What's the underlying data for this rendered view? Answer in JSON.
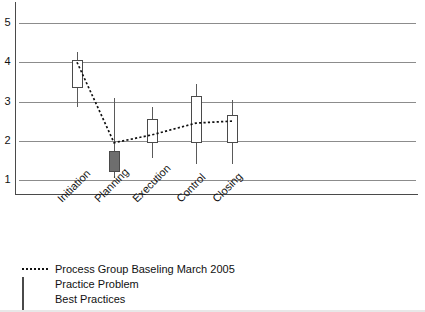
{
  "chart_data": {
    "type": "bar",
    "title": "",
    "subtitle": "",
    "xlabel": "",
    "ylabel": "",
    "categories": [
      "Initiation",
      "Planning",
      "Execution",
      "Control",
      "Closing"
    ],
    "ylim": [
      0.6,
      5.45
    ],
    "yticks": [
      1,
      2,
      3,
      4,
      5
    ],
    "ytick_labels": [
      "1",
      "2",
      "3",
      "4",
      "5"
    ],
    "grid": true,
    "legend_position": "below-axes-left",
    "boxes": [
      {
        "category": "Initiation",
        "kind": "Best Practices",
        "color": "#ffffff",
        "box_low": 3.35,
        "box_high": 4.05,
        "whisker_low": 2.85,
        "whisker_high": 4.25
      },
      {
        "category": "Planning",
        "kind": "Practice Problem",
        "color": "#6e6e6e",
        "box_low": 1.2,
        "box_high": 1.75,
        "whisker_low": 1.05,
        "whisker_high": 3.1
      },
      {
        "category": "Execution",
        "kind": "Best Practices",
        "color": "#ffffff",
        "box_low": 1.95,
        "box_high": 2.55,
        "whisker_low": 1.55,
        "whisker_high": 2.85
      },
      {
        "category": "Control",
        "kind": "Best Practices",
        "color": "#ffffff",
        "box_low": 1.95,
        "box_high": 3.15,
        "whisker_low": 1.4,
        "whisker_high": 3.45
      },
      {
        "category": "Closing",
        "kind": "Best Practices",
        "color": "#ffffff",
        "box_low": 1.95,
        "box_high": 2.65,
        "whisker_low": 1.4,
        "whisker_high": 3.05
      }
    ],
    "series": [
      {
        "name": "Process Group Baseling March 2005",
        "style": "dotted",
        "color": "#111111",
        "values": [
          4.0,
          1.95,
          2.15,
          2.45,
          2.5
        ]
      }
    ]
  },
  "axis": {
    "y_labels": [
      "5",
      "4",
      "3",
      "2",
      "1"
    ],
    "x_labels": [
      "Initiation",
      "Planning",
      "Execution",
      "Control",
      "Closing"
    ]
  },
  "legend": {
    "items": [
      {
        "label": "Process Group Baseling March 2005",
        "key": "dotted-line",
        "color": "#111111"
      },
      {
        "label": "Practice Problem",
        "key": "swatch",
        "color": "#6e6e6e"
      },
      {
        "label": "Best Practices",
        "key": "swatch",
        "color": "#d9d9d9"
      }
    ]
  }
}
